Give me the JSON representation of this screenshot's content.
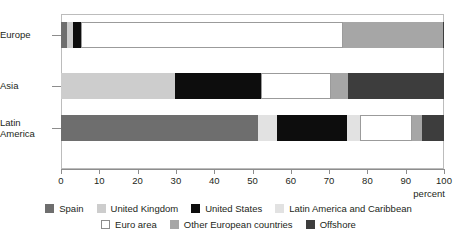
{
  "chart_data": {
    "type": "bar",
    "orientation": "horizontal",
    "stacked": true,
    "normalized": true,
    "title": "",
    "xlabel": "percent",
    "ylabel": "",
    "xlim": [
      0,
      100
    ],
    "grid": false,
    "legend_position": "bottom",
    "categories": [
      "Europe",
      "Asia",
      "Latin America"
    ],
    "category_labels": [
      {
        "line1": "Europe",
        "line2": ""
      },
      {
        "line1": "Asia",
        "line2": ""
      },
      {
        "line1": "Latin",
        "line2": "America"
      }
    ],
    "xticks": [
      0,
      10,
      20,
      30,
      40,
      50,
      60,
      70,
      80,
      90,
      100
    ],
    "xtick_labels": [
      "0",
      "10",
      "20",
      "30",
      "40",
      "50",
      "60",
      "70",
      "80",
      "90",
      "100"
    ],
    "series": [
      {
        "name": "Spain",
        "color": "#6e6e6e",
        "outlined": false,
        "values": [
          1.5,
          0.0,
          51.4
        ]
      },
      {
        "name": "United Kingdom",
        "color": "#cdcdcd",
        "outlined": false,
        "values": [
          1.6,
          29.8,
          0.0
        ]
      },
      {
        "name": "United States",
        "color": "#0d0d0d",
        "outlined": false,
        "values": [
          2.2,
          22.4,
          18.3
        ]
      },
      {
        "name": "Latin America and Caribbean",
        "color": "#e2e2e2",
        "outlined": false,
        "values": [
          0.0,
          0.0,
          3.4
        ]
      },
      {
        "name": "Euro area",
        "color": "#ffffff",
        "outlined": true,
        "values": [
          68.3,
          18.3,
          13.6
        ]
      },
      {
        "name": "Other European countries",
        "color": "#a6a6a6",
        "outlined": false,
        "values": [
          26.1,
          4.4,
          2.6
        ]
      },
      {
        "name": "Offshore",
        "color": "#3d3d3d",
        "outlined": false,
        "values": [
          0.3,
          25.1,
          10.7
        ]
      }
    ],
    "bars": [
      {
        "category": "Europe",
        "segments": [
          {
            "name": "Spain",
            "value": 1.5,
            "color": "#6e6e6e",
            "outlined": false
          },
          {
            "name": "United Kingdom",
            "value": 1.6,
            "color": "#cdcdcd",
            "outlined": false
          },
          {
            "name": "United States",
            "value": 2.2,
            "color": "#0d0d0d",
            "outlined": false
          },
          {
            "name": "Euro area",
            "value": 68.3,
            "color": "#ffffff",
            "outlined": true
          },
          {
            "name": "Other European countries",
            "value": 26.1,
            "color": "#a6a6a6",
            "outlined": false
          },
          {
            "name": "Offshore",
            "value": 0.3,
            "color": "#3d3d3d",
            "outlined": false
          }
        ]
      },
      {
        "category": "Asia",
        "segments": [
          {
            "name": "United Kingdom",
            "value": 29.8,
            "color": "#cdcdcd",
            "outlined": false
          },
          {
            "name": "United States",
            "value": 22.4,
            "color": "#0d0d0d",
            "outlined": false
          },
          {
            "name": "Euro area",
            "value": 18.3,
            "color": "#ffffff",
            "outlined": true
          },
          {
            "name": "Other European countries",
            "value": 4.4,
            "color": "#a6a6a6",
            "outlined": false
          },
          {
            "name": "Offshore",
            "value": 25.1,
            "color": "#3d3d3d",
            "outlined": false
          }
        ]
      },
      {
        "category": "Latin America",
        "segments": [
          {
            "name": "Spain",
            "value": 51.4,
            "color": "#6e6e6e",
            "outlined": false
          },
          {
            "name": "Latin America and Caribbean",
            "value": 5.0,
            "color": "#e2e2e2",
            "outlined": false
          },
          {
            "name": "United States",
            "value": 18.3,
            "color": "#0d0d0d",
            "outlined": false
          },
          {
            "name": "Latin America and Caribbean",
            "value": 3.4,
            "color": "#e2e2e2",
            "outlined": false
          },
          {
            "name": "Euro area",
            "value": 13.6,
            "color": "#ffffff",
            "outlined": true
          },
          {
            "name": "Other European countries",
            "value": 2.6,
            "color": "#a6a6a6",
            "outlined": false
          },
          {
            "name": "Offshore",
            "value": 5.7,
            "color": "#3d3d3d",
            "outlined": false
          }
        ]
      }
    ],
    "legend": {
      "row1": [
        {
          "label": "Spain",
          "color": "#6e6e6e",
          "outlined": false
        },
        {
          "label": "United Kingdom",
          "color": "#cdcdcd",
          "outlined": false
        },
        {
          "label": "United States",
          "color": "#0d0d0d",
          "outlined": false
        },
        {
          "label": "Latin America and Caribbean",
          "color": "#e2e2e2",
          "outlined": false
        }
      ],
      "row2": [
        {
          "label": "Euro area",
          "color": "#ffffff",
          "outlined": true
        },
        {
          "label": "Other European countries",
          "color": "#a6a6a6",
          "outlined": false
        },
        {
          "label": "Offshore",
          "color": "#3d3d3d",
          "outlined": false
        }
      ]
    }
  }
}
